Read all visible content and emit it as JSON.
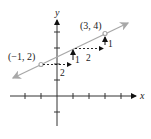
{
  "diagram": {
    "axes": {
      "x_label": "x",
      "y_label": "y"
    },
    "points": [
      {
        "label": "(−1, 2)",
        "x": -1,
        "y": 2
      },
      {
        "label": "(3, 4)",
        "x": 3,
        "y": 4
      }
    ],
    "steps": [
      {
        "run_label": "2",
        "rise_label": "1"
      },
      {
        "run_label": "2",
        "rise_label": "1"
      }
    ],
    "colors": {
      "line": "#a8a8a8",
      "axis": "#333333",
      "steps": "#111111",
      "point": "#a8a8a8"
    }
  }
}
